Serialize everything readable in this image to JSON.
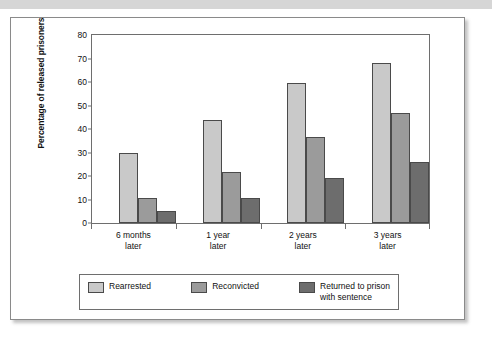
{
  "chart_data": {
    "type": "bar",
    "title": "",
    "xlabel": "",
    "ylabel": "Percentage of released prisoners",
    "ylim": [
      0,
      80
    ],
    "yticks": [
      0,
      10,
      20,
      30,
      40,
      50,
      60,
      70,
      80
    ],
    "grid": false,
    "legend_position": "bottom",
    "categories": [
      "6 months\nlater",
      "1 year\nlater",
      "2 years\nlater",
      "3 years\nlater"
    ],
    "series": [
      {
        "name": "Rearrested",
        "color": "#c9c9c9",
        "values": [
          30,
          44,
          59.5,
          68
        ]
      },
      {
        "name": "Reconvicted",
        "color": "#9b9b9b",
        "values": [
          10.5,
          21.5,
          36.5,
          47
        ]
      },
      {
        "name": "Returned to prison\nwith sentence",
        "color": "#6d6d6d",
        "values": [
          5,
          10.5,
          19,
          26
        ]
      }
    ]
  }
}
